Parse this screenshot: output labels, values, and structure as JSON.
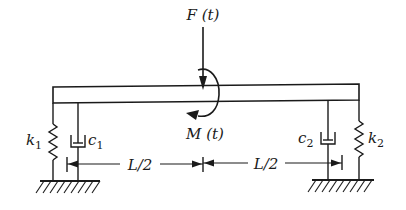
{
  "diagram": {
    "force_label": "F (t)",
    "moment_label": "M (t)",
    "left_support": {
      "spring_label": "k",
      "spring_subscript": "1",
      "damper_label": "c",
      "damper_subscript": "1"
    },
    "right_support": {
      "spring_label": "k",
      "spring_subscript": "2",
      "damper_label": "c",
      "damper_subscript": "2"
    },
    "dimensions": {
      "left_segment": "L/2",
      "right_segment": "L/2"
    },
    "colors": {
      "ink": "#1a1a1a",
      "background": "#ffffff"
    }
  }
}
